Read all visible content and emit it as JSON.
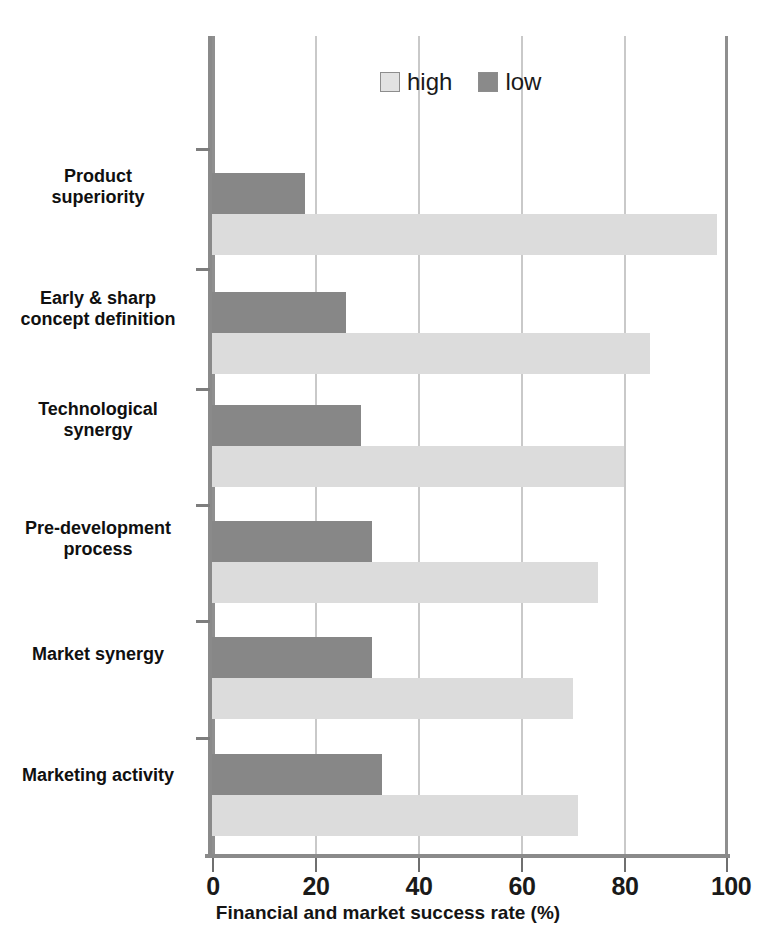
{
  "chart_data": {
    "type": "bar",
    "orientation": "horizontal",
    "title": "",
    "xlabel": "Financial and market success rate (%)",
    "ylabel": "",
    "xlim": [
      0,
      100
    ],
    "xticks": [
      0,
      20,
      40,
      60,
      80,
      100
    ],
    "grid": true,
    "legend_position": "top-center",
    "categories": [
      "Product superiority",
      "Early & sharp concept definition",
      "Technological synergy",
      "Pre-development process",
      "Market synergy",
      "Marketing activity"
    ],
    "category_lines": [
      [
        "Product",
        "superiority"
      ],
      [
        "Early & sharp",
        "concept definition"
      ],
      [
        "Technological",
        "synergy"
      ],
      [
        "Pre-development",
        "process"
      ],
      [
        "Market synergy"
      ],
      [
        "Marketing activity"
      ]
    ],
    "series": [
      {
        "name": "high",
        "color": "#dcdcdc",
        "values": [
          98,
          85,
          80,
          75,
          70,
          71
        ]
      },
      {
        "name": "low",
        "color": "#878787",
        "values": [
          18,
          26,
          29,
          31,
          31,
          33
        ]
      }
    ]
  },
  "legend": {
    "items": [
      {
        "label": "high",
        "swatch": "legend-swatch-high"
      },
      {
        "label": "low",
        "swatch": "legend-swatch-low"
      }
    ]
  },
  "axis": {
    "x_title": "Financial and market success rate (%)",
    "tick_labels": [
      "0",
      "20",
      "40",
      "60",
      "80",
      "100"
    ]
  },
  "colors": {
    "high": "#dcdcdc",
    "low": "#878787",
    "axis": "#8a8a8a",
    "grid": "#c9c9c9",
    "text": "#101010"
  }
}
